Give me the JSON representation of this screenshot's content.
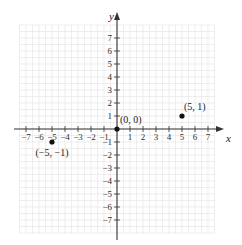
{
  "chart_data": {
    "type": "scatter",
    "title": "",
    "xlabel": "x",
    "ylabel": "y",
    "xlim": [
      -7.5,
      7.5
    ],
    "ylim": [
      -8,
      8
    ],
    "grid": true,
    "x_ticks": [
      -7,
      -6,
      -5,
      -4,
      -3,
      -2,
      -1,
      1,
      2,
      3,
      4,
      5,
      6,
      7
    ],
    "x_tick_labels": [
      "−7",
      "−6",
      "−5",
      "−4",
      "−3",
      "−2",
      "−1",
      "1",
      "2",
      "3",
      "4",
      "5",
      "6",
      "7"
    ],
    "y_ticks": [
      7,
      6,
      5,
      4,
      3,
      2,
      1,
      -1,
      -2,
      -3,
      -4,
      -5,
      -6,
      -7
    ],
    "y_tick_labels": [
      "7",
      "6",
      "5",
      "4",
      "3",
      "2",
      "1",
      "−1",
      "−2",
      "−3",
      "−4",
      "−5",
      "−6",
      "−7"
    ],
    "points": [
      {
        "x": 0,
        "y": 0,
        "label": "(0, 0)"
      },
      {
        "x": 5,
        "y": 1,
        "label": "(5, 1)"
      },
      {
        "x": -5,
        "y": -1,
        "label": "(−5, −1)"
      }
    ]
  },
  "colors": {
    "grid": "#e2e2e2",
    "axis": "#333333",
    "point": "#111111"
  }
}
